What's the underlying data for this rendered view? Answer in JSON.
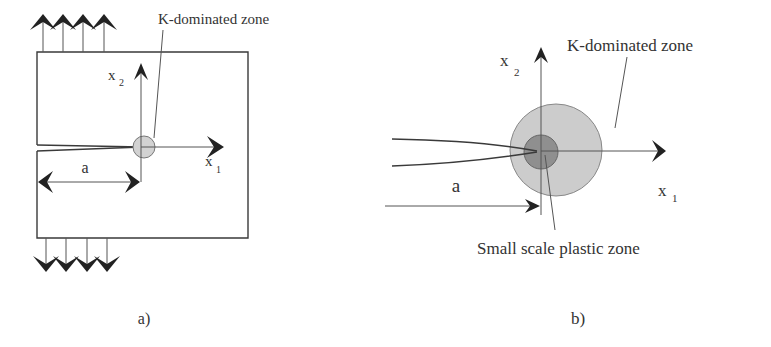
{
  "figure": {
    "panel_a": {
      "caption": "a)",
      "zone_label": "K-dominated zone",
      "axis_x1": "x",
      "axis_x1_sub": "1",
      "axis_x2": "x",
      "axis_x2_sub": "2",
      "crack_length_label": "a"
    },
    "panel_b": {
      "caption": "b)",
      "zone_label": "K-dominated zone",
      "plastic_zone_label": "Small scale plastic zone",
      "axis_x1": "x",
      "axis_x1_sub": "1",
      "axis_x2": "x",
      "axis_x2_sub": "2",
      "crack_length_label": "a"
    },
    "colors": {
      "k_zone_fill": "#c8c8c8",
      "plastic_zone_fill": "#8e8e8e",
      "small_zone_fill_a": "#cfcfcf",
      "line": "#3a3a3a"
    }
  }
}
